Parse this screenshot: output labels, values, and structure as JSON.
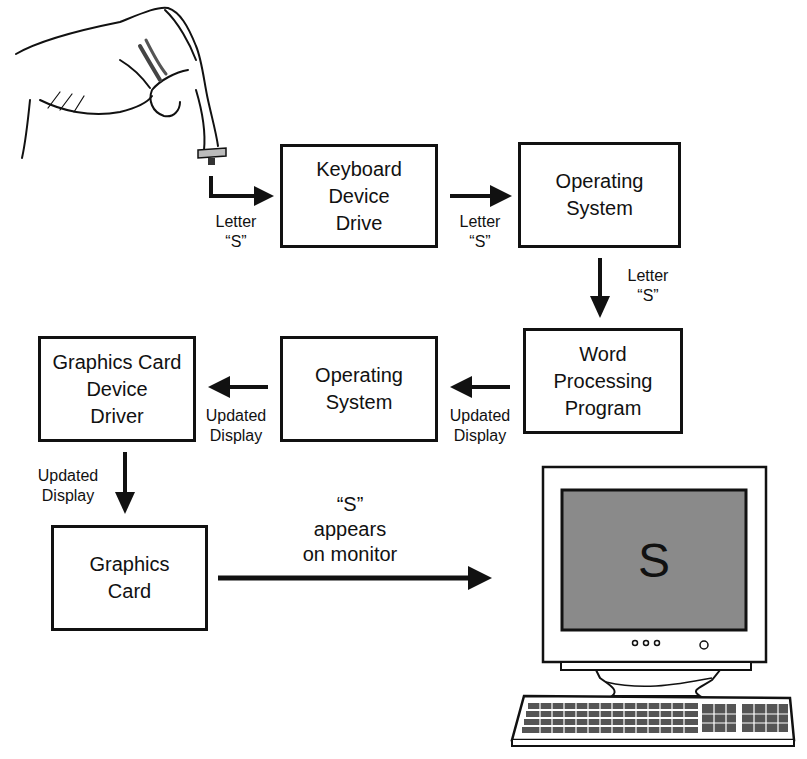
{
  "diagram": {
    "nodes": [
      {
        "id": "keyboard-device-drive",
        "label": "Keyboard\nDevice\nDrive"
      },
      {
        "id": "operating-system-1",
        "label": "Operating\nSystem"
      },
      {
        "id": "word-processing-program",
        "label": "Word\nProcessing\nProgram"
      },
      {
        "id": "operating-system-2",
        "label": "Operating\nSystem"
      },
      {
        "id": "graphics-card-device-driver",
        "label": "Graphics Card\nDevice\nDriver"
      },
      {
        "id": "graphics-card",
        "label": "Graphics\nCard"
      }
    ],
    "edges": [
      {
        "from": "key-press",
        "to": "keyboard-device-drive",
        "label": "Letter\n“S”"
      },
      {
        "from": "keyboard-device-drive",
        "to": "operating-system-1",
        "label": "Letter\n“S”"
      },
      {
        "from": "operating-system-1",
        "to": "word-processing-program",
        "label": "Letter\n“S”"
      },
      {
        "from": "word-processing-program",
        "to": "operating-system-2",
        "label": "Updated\nDisplay"
      },
      {
        "from": "operating-system-2",
        "to": "graphics-card-device-driver",
        "label": "Updated\nDisplay"
      },
      {
        "from": "graphics-card-device-driver",
        "to": "graphics-card",
        "label": "Updated\nDisplay"
      },
      {
        "from": "graphics-card",
        "to": "monitor",
        "label": "“S”\nappears\non monitor"
      }
    ],
    "monitor": {
      "screen_text": "S",
      "screen_color": "#8a8a8a"
    },
    "illustrations": [
      "hand-pressing-key",
      "computer-monitor-with-keyboard"
    ]
  }
}
